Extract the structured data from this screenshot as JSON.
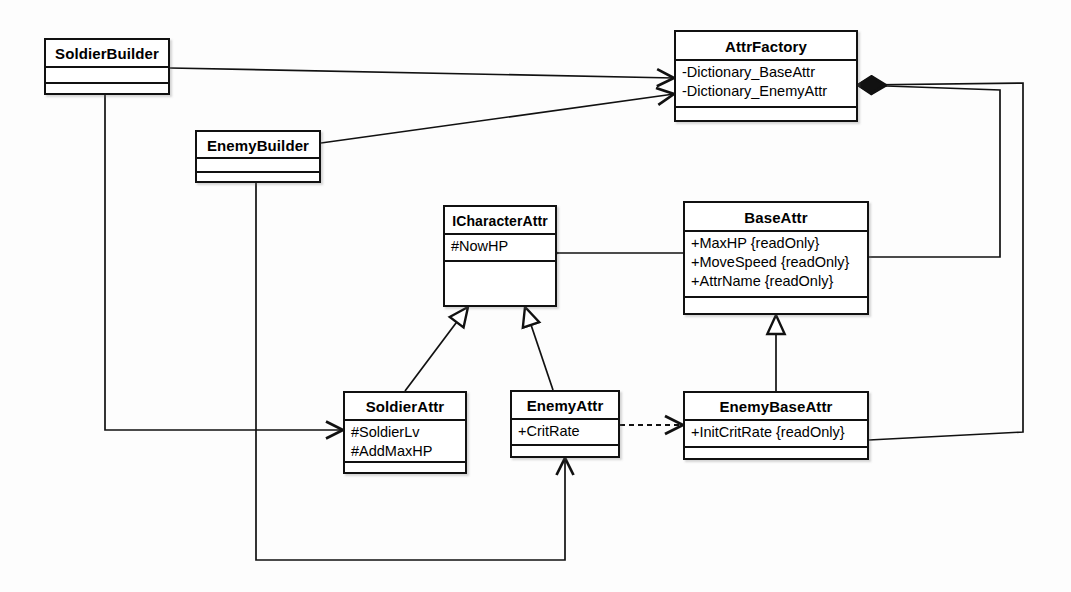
{
  "diagram": {
    "kind": "uml-class-diagram",
    "background_color": "#fdfdfd",
    "line_color": "#111111",
    "fill_color": "#ffffff",
    "width": 1071,
    "height": 592
  },
  "classes": [
    {
      "id": "soldier-builder",
      "name": "SoldierBuilder",
      "attributes": [],
      "operations": [],
      "x": 44,
      "y": 38,
      "w": 126,
      "h": 57,
      "name_h": 26,
      "attrs_h": 16
    },
    {
      "id": "enemy-builder",
      "name": "EnemyBuilder",
      "attributes": [],
      "operations": [],
      "x": 195,
      "y": 130,
      "w": 126,
      "h": 53,
      "name_h": 25,
      "attrs_h": 14
    },
    {
      "id": "attr-factory",
      "name": "AttrFactory",
      "attributes": [
        "-Dictionary_BaseAttr",
        "-Dictionary_EnemyAttr"
      ],
      "operations": [],
      "x": 674,
      "y": 30,
      "w": 184,
      "h": 92,
      "name_h": 27,
      "attrs_h": 47
    },
    {
      "id": "icharacter-attr",
      "name": "ICharacterAttr",
      "attributes": [
        "#NowHP"
      ],
      "operations": [],
      "x": 443,
      "y": 205,
      "w": 114,
      "h": 102,
      "name_h": 26,
      "attrs_h": 27
    },
    {
      "id": "base-attr",
      "name": "BaseAttr",
      "attributes": [
        "+MaxHP {readOnly}",
        "+MoveSpeed {readOnly}",
        "+AttrName {readOnly}"
      ],
      "operations": [],
      "x": 683,
      "y": 201,
      "w": 186,
      "h": 114,
      "name_h": 27,
      "attrs_h": 66
    },
    {
      "id": "soldier-attr",
      "name": "SoldierAttr",
      "attributes": [
        "#SoldierLv",
        "#AddMaxHP"
      ],
      "operations": [],
      "x": 343,
      "y": 391,
      "w": 124,
      "h": 83,
      "name_h": 26,
      "attrs_h": 42
    },
    {
      "id": "enemy-attr",
      "name": "EnemyAttr",
      "attributes": [
        "+CritRate"
      ],
      "operations": [],
      "x": 510,
      "y": 390,
      "w": 110,
      "h": 68,
      "name_h": 26,
      "attrs_h": 26
    },
    {
      "id": "enemy-base-attr",
      "name": "EnemyBaseAttr",
      "attributes": [
        "+InitCritRate {readOnly}"
      ],
      "operations": [],
      "x": 683,
      "y": 391,
      "w": 186,
      "h": 69,
      "name_h": 26,
      "attrs_h": 27
    }
  ],
  "relationships": [
    {
      "id": "rel-soldierbuilder-attrfactory",
      "type": "association",
      "source": "soldier-builder",
      "target": "attr-factory",
      "arrow": "open-arrow",
      "style": "solid",
      "points": "170,68 674,78"
    },
    {
      "id": "rel-enemybuilder-attrfactory",
      "type": "association",
      "source": "enemy-builder",
      "target": "attr-factory",
      "arrow": "open-arrow",
      "style": "solid",
      "points": "321,143 674,94"
    },
    {
      "id": "rel-soldierbuilder-soldierattr",
      "type": "association",
      "source": "soldier-builder",
      "target": "soldier-attr",
      "arrow": "open-arrow",
      "style": "solid",
      "points": "105,95 105,430 343,430"
    },
    {
      "id": "rel-enemybuilder-enemyattr",
      "type": "association",
      "source": "enemy-builder",
      "target": "enemy-attr",
      "arrow": "open-arrow",
      "style": "solid",
      "points": "256,183 256,560 565,560 565,458"
    },
    {
      "id": "rel-icharacterattr-baseattr",
      "type": "aggregation",
      "source": "icharacter-attr",
      "target": "base-attr",
      "arrow": "hollow-diamond",
      "style": "solid",
      "points": "557,253 683,253"
    },
    {
      "id": "rel-soldierattr-icharacterattr",
      "type": "generalization",
      "source": "soldier-attr",
      "target": "icharacter-attr",
      "arrow": "hollow-triangle",
      "style": "solid",
      "points": "405,391 468,307"
    },
    {
      "id": "rel-enemyattr-icharacterattr",
      "type": "generalization",
      "source": "enemy-attr",
      "target": "icharacter-attr",
      "arrow": "hollow-triangle",
      "style": "solid",
      "points": "553,390 525,307"
    },
    {
      "id": "rel-enemybaseattr-baseattr",
      "type": "generalization",
      "source": "enemy-base-attr",
      "target": "base-attr",
      "arrow": "hollow-triangle",
      "style": "solid",
      "points": "776,391 776,315"
    },
    {
      "id": "rel-enemyattr-enemybaseattr",
      "type": "dependency",
      "source": "enemy-attr",
      "target": "enemy-base-attr",
      "arrow": "open-arrow",
      "style": "dashed",
      "points": "620,425 683,425"
    },
    {
      "id": "rel-attrfactory-baseattr",
      "type": "composition",
      "source": "attr-factory",
      "target": "base-attr",
      "arrow": "filled-diamond",
      "style": "solid",
      "points": "858,85 1000,90 1000,257 869,257"
    },
    {
      "id": "rel-attrfactory-enemybaseattr",
      "type": "composition",
      "source": "attr-factory",
      "target": "enemy-base-attr",
      "arrow": "filled-diamond",
      "style": "solid",
      "points": "858,85 1023,83 1023,432 869,440"
    }
  ]
}
